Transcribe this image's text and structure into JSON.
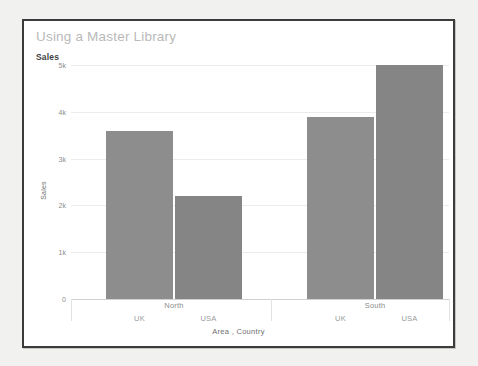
{
  "window": {
    "background_color": "#f1f1ef",
    "card_background": "#ffffff",
    "card_border_color": "#3c3c3c"
  },
  "header": {
    "title": "Using a Master Library",
    "measure_label": "Sales"
  },
  "chart_data": {
    "type": "bar",
    "title": "Using a Master Library",
    "xlabel": "Area , Country",
    "ylabel": "Sales",
    "ylim": [
      0,
      5200
    ],
    "yticks": [
      0,
      1000,
      2000,
      3000,
      4000,
      5000
    ],
    "ytick_labels": [
      "0",
      "1k",
      "2k",
      "3k",
      "4k",
      "5k"
    ],
    "grid": true,
    "legend": "none",
    "bar_color": "#8d8d8d",
    "bar_color_alt": "#858585",
    "groups": [
      "North",
      "South"
    ],
    "categories": [
      "UK",
      "USA",
      "UK",
      "USA"
    ],
    "bars": [
      {
        "group": "North",
        "category": "UK",
        "value": 3590,
        "color": "#8d8d8d"
      },
      {
        "group": "North",
        "category": "USA",
        "value": 2210,
        "color": "#858585"
      },
      {
        "group": "South",
        "category": "UK",
        "value": 3890,
        "color": "#8d8d8d"
      },
      {
        "group": "South",
        "category": "USA",
        "value": 5010,
        "color": "#858585"
      }
    ],
    "values": [
      3590,
      2210,
      3890,
      5010
    ]
  }
}
